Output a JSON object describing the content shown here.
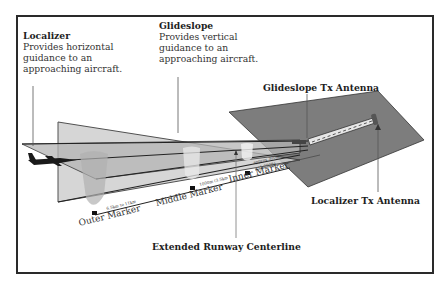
{
  "diagram": {
    "localizer": {
      "title": "Localizer",
      "desc_lines": [
        "Provides horizontal",
        "guidance to an",
        "approaching aircraft."
      ]
    },
    "glideslope": {
      "title": "Glideslope",
      "desc_lines": [
        "Provides vertical",
        "guidance to an",
        "approaching aircraft."
      ]
    },
    "glideslope_antenna": "Glideslope Tx Antenna",
    "localizer_antenna": "Localizer Tx Antenna",
    "centerline": "Extended Runway Centerline",
    "markers": {
      "outer": "Outer Marker",
      "middle": "Middle Marker",
      "inner": "Inner Marker"
    },
    "distances": {
      "outer": "6.5km to 11km",
      "middle": "1000m  (3.5km",
      "inner": "approx 300m",
      "inner2": "(1,000ft)"
    },
    "colors": {
      "frame": "#2a2a2a",
      "ground_plane": "#7d7d7d",
      "localizer_plane": "#c9c9c9",
      "glide_plane": "#b3b3b3",
      "marker_beam": "#bdbdbd",
      "text": "#1e1e1e"
    }
  }
}
